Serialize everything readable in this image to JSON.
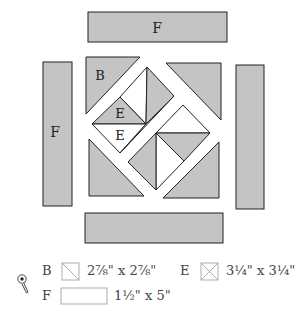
{
  "diagram": {
    "colors": {
      "fill": "#c4c4c4",
      "stroke": "#222222",
      "background": "#ffffff"
    },
    "labels": {
      "top_strip": "F",
      "left_strip": "F",
      "triangle_b": "B",
      "triangle_e_upper": "E",
      "triangle_e_lower": "E"
    }
  },
  "legend": {
    "icon": "rotary-cutter-icon",
    "items": [
      {
        "letter": "B",
        "swatch": "square-single-diagonal",
        "size": "2⅞\" x 2⅞\""
      },
      {
        "letter": "E",
        "swatch": "square-double-diagonal",
        "size": "3¼\" x 3¼\""
      },
      {
        "letter": "F",
        "swatch": "rectangle",
        "size": "1½\" x 5\""
      }
    ]
  }
}
